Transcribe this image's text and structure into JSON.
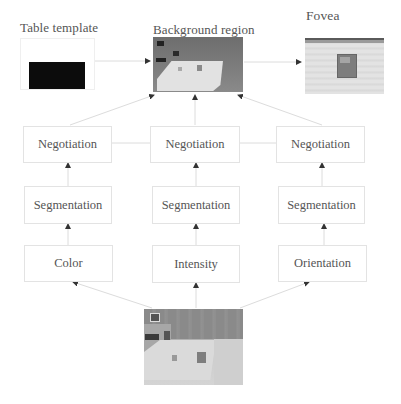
{
  "diagram": {
    "top": {
      "table_template": {
        "label": "Table template"
      },
      "background_region": {
        "label": "Background region"
      },
      "fovea": {
        "label": "Fovea"
      }
    },
    "columns": [
      {
        "negotiation": "Negotiation",
        "segmentation": "Segmentation",
        "feature": "Color"
      },
      {
        "negotiation": "Negotiation",
        "segmentation": "Segmentation",
        "feature": "Intensity"
      },
      {
        "negotiation": "Negotiation",
        "segmentation": "Segmentation",
        "feature": "Orientation"
      }
    ],
    "input_image": {
      "description": "scene photo of table with objects"
    },
    "colors": {
      "box_border": "#e3e3e3",
      "connector": "#dcdcdc",
      "arrowhead": "#333333",
      "text": "#555555",
      "template_fill": "#0c0c0c"
    }
  }
}
